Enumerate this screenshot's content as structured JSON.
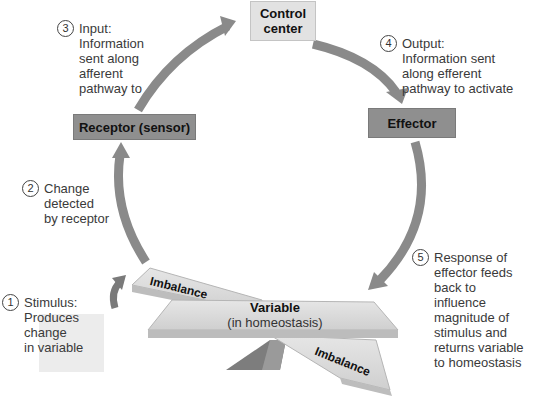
{
  "diagram": {
    "type": "homeostasis feedback loop",
    "boxes": {
      "control_center": "Control\ncenter",
      "receptor": "Receptor (sensor)",
      "effector": "Effector"
    },
    "steps": [
      {
        "number": "1",
        "text": "Stimulus:\nProduces\nchange\nin variable"
      },
      {
        "number": "2",
        "text": "Change\ndetected\nby receptor"
      },
      {
        "number": "3",
        "text": "Input:\nInformation\nsent along\nafferent\npathway to"
      },
      {
        "number": "4",
        "text": "Output:\nInformation sent\nalong efferent\npathway to activate"
      },
      {
        "number": "5",
        "text": "Response of\neffector feeds\nback to\ninfluence\nmagnitude of\nstimulus and\nreturns variable\nto homeostasis"
      }
    ],
    "balance": {
      "variable_title": "Variable",
      "variable_subtitle": "(in homeostasis)",
      "imbalance_left": "Imbalance",
      "imbalance_right": "Imbalance"
    },
    "colors": {
      "arrow": "#8a8a8a",
      "dark_box": "#8f8f8f",
      "light_box": "#e2e2e2",
      "plank": "#d6d6d6",
      "fulcrum": "#7d7d7d"
    }
  }
}
